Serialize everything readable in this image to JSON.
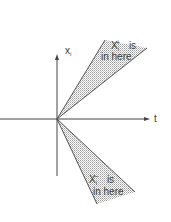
{
  "diagram": {
    "axes": {
      "vertical_label": "x",
      "vertical_label_sub": "i",
      "horizontal_label": "t"
    },
    "upper_cone": {
      "label_var": "X",
      "label_sub": "i",
      "label_sup": "+",
      "label_line1_suffix": "is",
      "label_line2": "in here"
    },
    "lower_cone": {
      "label_var": "X",
      "label_sub": "i",
      "label_sup": "−",
      "label_line1_suffix": "is",
      "label_line2": "in here"
    },
    "colors": {
      "line": "#444444",
      "shade": "#cfcfcf"
    }
  }
}
